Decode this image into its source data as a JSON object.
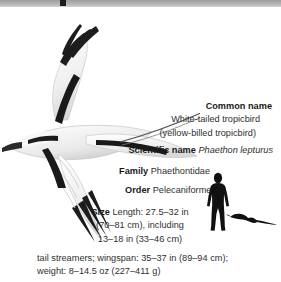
{
  "page": {
    "background_color": "#ffffff",
    "text_color": "#2f2f2f",
    "band_color": "#adadad",
    "mark_color": "#1c1c1c"
  },
  "illustration": {
    "subject": "white-tailed-tropicbird-in-flight",
    "plumage_color": "#f4f4f4",
    "marking_color": "#1a1a1a",
    "shade_color": "#cfcfcf"
  },
  "facts": {
    "common_name": {
      "label": "Common name",
      "value_line_1": "White-tailed tropicbird",
      "value_line_2": "(yellow-billed tropicbird)"
    },
    "scientific_name": {
      "label": "Scientific name",
      "value": "Phaethon lepturus"
    },
    "family": {
      "label": "Family",
      "value": "Phaethontidae"
    },
    "order": {
      "label": "Order",
      "value": "Pelecaniformes"
    },
    "size": {
      "label": "Size",
      "line_1": "Length: 27.5–32 in",
      "line_2": "(70–81 cm), including",
      "line_3": "13–18 in (33–46 cm)"
    },
    "extra": {
      "line_1": "tail streamers; wingspan: 35–37 in (89–94 cm);",
      "line_2": "weight: 8–14.5 oz (227–411 g)"
    }
  },
  "scale_figures": {
    "human": "human-silhouette",
    "bird": "tropicbird-silhouette",
    "fill_color": "#111111"
  }
}
